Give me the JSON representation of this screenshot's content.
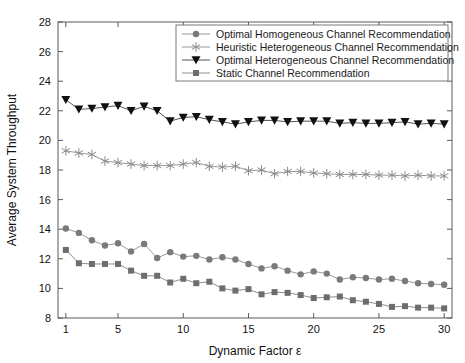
{
  "chart_data": {
    "type": "line",
    "title": "",
    "xlabel": "Dynamic Factor ε",
    "ylabel": "Average System Throughput",
    "xlim": [
      0.4,
      30.6
    ],
    "ylim": [
      8,
      28
    ],
    "xticks": [
      1,
      5,
      10,
      15,
      20,
      25,
      30
    ],
    "xtick_labels": [
      "1",
      "5",
      "10",
      "15",
      "20",
      "25",
      "30"
    ],
    "yticks": [
      8,
      10,
      12,
      14,
      16,
      18,
      20,
      22,
      24,
      26,
      28
    ],
    "ytick_labels": [
      "8",
      "10",
      "12",
      "14",
      "16",
      "18",
      "20",
      "22",
      "24",
      "26",
      "28"
    ],
    "grid": false,
    "legend_position": "upper center",
    "x": [
      1,
      2,
      3,
      4,
      5,
      6,
      7,
      8,
      9,
      10,
      11,
      12,
      13,
      14,
      15,
      16,
      17,
      18,
      19,
      20,
      21,
      22,
      23,
      24,
      25,
      26,
      27,
      28,
      29,
      30
    ],
    "series": [
      {
        "name": "Optimal Homogeneous Channel Recommendation",
        "marker": "circle",
        "color": "#7a7a7a",
        "line_color": "#9a9a9a",
        "values": [
          14.05,
          13.75,
          13.25,
          12.9,
          13.05,
          12.5,
          13.0,
          12.05,
          12.45,
          12.15,
          12.2,
          11.95,
          12.1,
          11.95,
          11.65,
          11.35,
          11.5,
          11.2,
          10.95,
          11.15,
          11.0,
          10.6,
          10.75,
          10.7,
          10.6,
          10.65,
          10.5,
          10.35,
          10.3,
          10.25
        ]
      },
      {
        "name": "Heuristic Heterogeneous Channel Recommendation",
        "marker": "asterisk",
        "color": "#8a8a8a",
        "line_color": "#9a9a9a",
        "values": [
          19.3,
          19.15,
          19.05,
          18.6,
          18.5,
          18.4,
          18.3,
          18.3,
          18.3,
          18.4,
          18.5,
          18.25,
          18.2,
          18.25,
          17.95,
          18.0,
          17.75,
          17.9,
          17.9,
          17.8,
          17.75,
          17.7,
          17.7,
          17.7,
          17.65,
          17.65,
          17.6,
          17.65,
          17.6,
          17.6
        ]
      },
      {
        "name": "Optimal Heterogeneous Channel Recommendation",
        "marker": "triangle-down",
        "color": "#111111",
        "line_color": "#555555",
        "values": [
          22.75,
          22.1,
          22.15,
          22.25,
          22.35,
          22.0,
          22.3,
          22.0,
          21.3,
          21.55,
          21.6,
          21.4,
          21.25,
          21.1,
          21.25,
          21.35,
          21.35,
          21.25,
          21.3,
          21.3,
          21.3,
          21.15,
          21.2,
          21.15,
          21.15,
          21.2,
          21.25,
          21.1,
          21.15,
          21.1
        ]
      },
      {
        "name": "Static Channel Recommendation",
        "marker": "square",
        "color": "#6d6d6d",
        "line_color": "#8d8d8d",
        "values": [
          12.6,
          11.7,
          11.65,
          11.65,
          11.65,
          11.2,
          10.85,
          10.85,
          10.4,
          10.65,
          10.35,
          10.45,
          10.0,
          9.85,
          9.95,
          9.6,
          9.75,
          9.7,
          9.55,
          9.35,
          9.4,
          9.45,
          9.2,
          9.1,
          8.95,
          8.75,
          8.8,
          8.7,
          8.7,
          8.65
        ]
      }
    ]
  }
}
